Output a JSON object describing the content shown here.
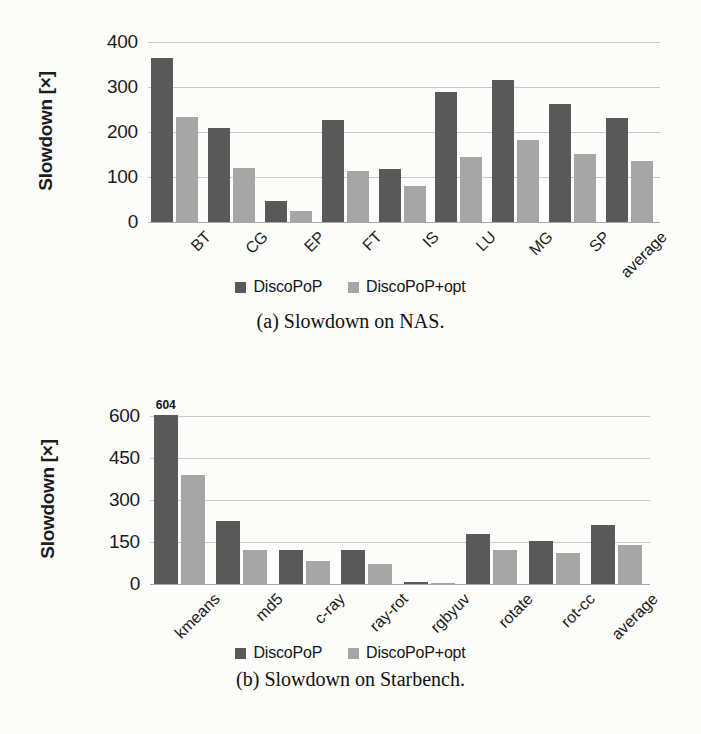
{
  "figures": [
    {
      "id": "a",
      "caption": "(a) Slowdown on NAS.",
      "chart_data": {
        "type": "bar",
        "title": "",
        "xlabel": "",
        "ylabel": "Slowdown [×]",
        "ylim": [
          0,
          400
        ],
        "yticks": [
          "0",
          "100",
          "200",
          "300",
          "400"
        ],
        "ytick_values": [
          0,
          100,
          200,
          300,
          400
        ],
        "grid": true,
        "legend_position": "bottom",
        "categories": [
          "BT",
          "CG",
          "EP",
          "FT",
          "IS",
          "LU",
          "MG",
          "SP",
          "average"
        ],
        "series": [
          {
            "name": "DiscoPoP",
            "color": "#595959",
            "values": [
              365,
              209,
              47,
              227,
              118,
              290,
              315,
              262,
              232
            ],
            "labels": [
              "",
              "",
              "",
              "",
              "",
              "",
              "",
              "",
              ""
            ]
          },
          {
            "name": "DiscoPoP+opt",
            "color": "#a6a6a6",
            "values": [
              233,
              120,
              25,
              113,
              81,
              145,
              182,
              152,
              135
            ],
            "labels": [
              "",
              "",
              "",
              "",
              "",
              "",
              "",
              "",
              ""
            ]
          }
        ]
      },
      "legend": [
        {
          "label": "DiscoPoP",
          "swatch": "dark"
        },
        {
          "label": "DiscoPoP+opt",
          "swatch": "light"
        }
      ]
    },
    {
      "id": "b",
      "caption": "(b) Slowdown on Starbench.",
      "chart_data": {
        "type": "bar",
        "title": "",
        "xlabel": "",
        "ylabel": "Slowdown [×]",
        "ylim": [
          0,
          600
        ],
        "yticks": [
          "0",
          "150",
          "300",
          "450",
          "600"
        ],
        "ytick_values": [
          0,
          150,
          300,
          450,
          600
        ],
        "grid": true,
        "legend_position": "bottom",
        "categories": [
          "kmeans",
          "md5",
          "c-ray",
          "ray-rot",
          "rgbyuv",
          "rotate",
          "rot-cc",
          "average"
        ],
        "series": [
          {
            "name": "DiscoPoP",
            "color": "#595959",
            "values": [
              604,
              225,
              122,
              122,
              6,
              180,
              155,
              210
            ],
            "labels": [
              "604",
              "",
              "",
              "",
              "",
              "",
              "",
              ""
            ]
          },
          {
            "name": "DiscoPoP+opt",
            "color": "#a6a6a6",
            "values": [
              390,
              122,
              82,
              70,
              4,
              120,
              110,
              140
            ],
            "labels": [
              "",
              "",
              "",
              "",
              "",
              "",
              "",
              ""
            ]
          }
        ]
      },
      "legend": [
        {
          "label": "DiscoPoP",
          "swatch": "dark"
        },
        {
          "label": "DiscoPoP+opt",
          "swatch": "light"
        }
      ]
    }
  ]
}
